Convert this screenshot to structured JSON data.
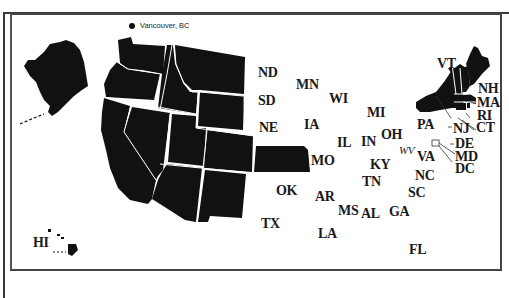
{
  "map": {
    "type": "US states selection map",
    "fill_color": "#111111",
    "border_color": "#ffffff",
    "background": "#ffffff",
    "city_marker": {
      "label": "Vancouver, BC",
      "icon": "filled-circle"
    },
    "filled_states": [
      "AK",
      "WA",
      "OR",
      "CA",
      "ID",
      "NV",
      "MT",
      "WY",
      "UT",
      "AZ",
      "CO",
      "NM",
      "KS",
      "NY",
      "VT",
      "NH",
      "ME",
      "MA",
      "CT",
      "RI",
      "HI"
    ],
    "labels": {
      "ND": "ND",
      "MN": "MN",
      "SD": "SD",
      "WI": "WI",
      "NE": "NE",
      "IA": "IA",
      "MI": "MI",
      "IL": "IL",
      "IN": "IN",
      "OH": "OH",
      "PA": "PA",
      "WV": "WV",
      "VA": "VA",
      "KY": "KY",
      "MO": "MO",
      "TN": "TN",
      "NC": "NC",
      "SC": "SC",
      "OK": "OK",
      "AR": "AR",
      "MS": "MS",
      "AL": "AL",
      "GA": "GA",
      "TX": "TX",
      "LA": "LA",
      "FL": "FL",
      "HI": "HI",
      "VT": "VT",
      "NH": "NH",
      "MA": "MA",
      "RI": "RI",
      "CT": "CT",
      "NJ": "NJ",
      "DE": "DE",
      "MD": "MD",
      "DC": "DC"
    }
  }
}
